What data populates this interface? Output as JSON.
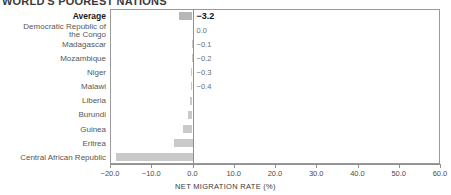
{
  "chart_data": {
    "type": "bar",
    "orientation": "horizontal",
    "title": "WORLD'S POOREST NATIONS",
    "xlabel": "NET MIGRATION RATE (%)",
    "ylabel": "",
    "xlim": [
      -20.0,
      60.0
    ],
    "xticks": [
      -20.0,
      -10.0,
      0.0,
      10.0,
      20.0,
      30.0,
      40.0,
      50.0,
      60.0
    ],
    "xtick_labels": [
      "-20.0",
      "-10.0",
      "0.0",
      "10.0",
      "20.0",
      "30.0",
      "40.0",
      "50.0",
      "60.0"
    ],
    "grid": false,
    "legend": null,
    "bar_color": "#c9c9c9",
    "average_bar_color": "#b7b7b7",
    "zero_line": 0.0,
    "categories": [
      "Average",
      "Democratic Republic of\nthe Congo",
      "Madagascar",
      "Mozambique",
      "Niger",
      "Malawi",
      "Liberia",
      "Burundi",
      "Guinea",
      "Eritrea",
      "Central African Republic"
    ],
    "values": [
      -3.2,
      0.0,
      -0.1,
      -0.2,
      -0.3,
      -0.4,
      -0.6,
      -1.1,
      -2.3,
      -4.5,
      -18.5
    ],
    "value_labels": [
      "-3.2",
      "0.0",
      "-0.1",
      "-0.2",
      "-0.3",
      "-0.4",
      "",
      "",
      "",
      "",
      ""
    ]
  },
  "axis": {
    "x_title": "NET MIGRATION RATE (%)"
  },
  "title": {
    "text": "WORLD'S POOREST NATIONS"
  }
}
